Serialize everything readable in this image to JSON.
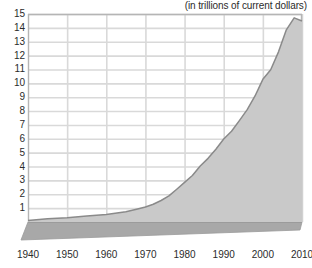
{
  "chart_data": {
    "type": "area",
    "title": "",
    "subtitle": "(in trillions of current dollars)",
    "xlabel": "",
    "ylabel": "",
    "xlim": [
      1940,
      2010
    ],
    "ylim": [
      0,
      15
    ],
    "grid": true,
    "legend": false,
    "style": "3d-area",
    "area_color": "#c9c9c9",
    "line_color": "#8a8a8a",
    "base_color": "#a8a8a8",
    "grid_color": "#d9d9d9",
    "axis_color": "#b5b5b5",
    "xticks": [
      1940,
      1950,
      1960,
      1970,
      1980,
      1990,
      2000,
      2010
    ],
    "xtick_labels": [
      "1940",
      "1950",
      "1960",
      "1970",
      "1980",
      "1990",
      "2000",
      "2010"
    ],
    "yticks": [
      1,
      2,
      3,
      4,
      5,
      6,
      7,
      8,
      9,
      10,
      11,
      12,
      13,
      14,
      15
    ],
    "ytick_labels": [
      "1",
      "2",
      "3",
      "4",
      "5",
      "6",
      "7",
      "8",
      "9",
      "10",
      "11",
      "12",
      "13",
      "14",
      "15"
    ],
    "x": [
      1940,
      1945,
      1950,
      1955,
      1960,
      1965,
      1968,
      1970,
      1972,
      1974,
      1976,
      1978,
      1980,
      1982,
      1984,
      1986,
      1988,
      1990,
      1992,
      1994,
      1996,
      1998,
      2000,
      2002,
      2004,
      2006,
      2008,
      2010
    ],
    "values": [
      0.1,
      0.23,
      0.3,
      0.43,
      0.54,
      0.74,
      0.94,
      1.08,
      1.28,
      1.55,
      1.88,
      2.36,
      2.86,
      3.35,
      4.04,
      4.59,
      5.25,
      5.98,
      6.54,
      7.31,
      8.1,
      9.09,
      10.29,
      10.98,
      12.27,
      13.86,
      14.72,
      14.5
    ],
    "units": "trillions of current dollars"
  }
}
